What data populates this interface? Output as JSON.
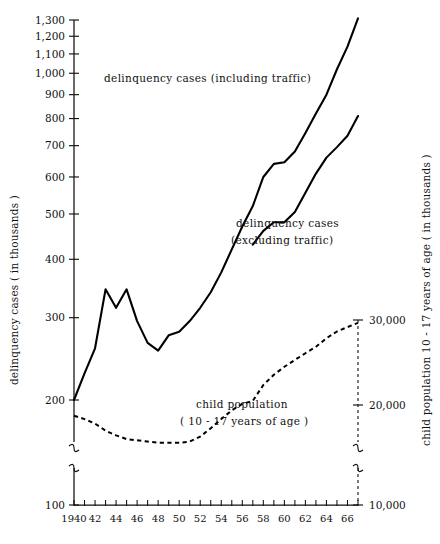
{
  "chart_data": {
    "type": "line",
    "title": "",
    "subtitle": "",
    "xlabel": "",
    "ylabel": "delinquency cases ( in thousands )",
    "y2label": "child population 10 - 17 years of age ( in thousands )",
    "scale": "log",
    "grid": false,
    "legend_position": "inline-annotation",
    "xlim": [
      1940,
      1967
    ],
    "ylim": [
      100,
      1300
    ],
    "y2lim": [
      10000,
      30000
    ],
    "x_tick_labels": [
      "1940",
      "42",
      "44",
      "46",
      "48",
      "50",
      "52",
      "54",
      "56",
      "58",
      "60",
      "62",
      "64",
      "66"
    ],
    "x_tick_values": [
      1940,
      1942,
      1944,
      1946,
      1948,
      1950,
      1952,
      1954,
      1956,
      1958,
      1960,
      1962,
      1964,
      1966
    ],
    "x_minor_ticks": [
      1941,
      1943,
      1945,
      1947,
      1949,
      1951,
      1953,
      1955,
      1957,
      1959,
      1961,
      1963,
      1965,
      1967
    ],
    "y_tick_labels": [
      "100",
      "200",
      "300",
      "400",
      "500",
      "600",
      "700",
      "800",
      "900",
      "1,000",
      "1,100",
      "1,200",
      "1,300"
    ],
    "y_tick_values": [
      100,
      200,
      300,
      400,
      500,
      600,
      700,
      800,
      900,
      1000,
      1100,
      1200,
      1300
    ],
    "y_axis_break_after": 100,
    "y2_tick_labels": [
      "10,000",
      "20,000",
      "30,000"
    ],
    "y2_tick_values": [
      10000,
      20000,
      30000
    ],
    "y2_axis_break_after": 10000,
    "series": [
      {
        "name": "delinquency cases (including traffic)",
        "annotation": "delinquency cases (including traffic)",
        "style": "solid",
        "axis": "left",
        "x": [
          1940,
          1941,
          1942,
          1943,
          1944,
          1945,
          1946,
          1947,
          1948,
          1949,
          1950,
          1951,
          1952,
          1953,
          1954,
          1955,
          1956,
          1957,
          1958,
          1959,
          1960,
          1961,
          1962,
          1963,
          1964,
          1965,
          1966,
          1967
        ],
        "values": [
          200,
          228,
          258,
          345,
          315,
          345,
          295,
          265,
          255,
          275,
          280,
          295,
          315,
          340,
          375,
          420,
          470,
          520,
          600,
          640,
          645,
          680,
          745,
          820,
          900,
          1020,
          1140,
          1310
        ]
      },
      {
        "name": "delinquency cases (excluding traffic)",
        "annotation_line1": "delinquency cases",
        "annotation_line2": "(excluding traffic)",
        "style": "solid",
        "axis": "left",
        "x": [
          1957,
          1958,
          1959,
          1960,
          1961,
          1962,
          1963,
          1964,
          1965,
          1966,
          1967
        ],
        "values": [
          430,
          460,
          480,
          480,
          505,
          555,
          610,
          660,
          695,
          735,
          810
        ]
      },
      {
        "name": "child population (10 - 17 years of age)",
        "annotation_line1": "child population",
        "annotation_line2": "( 10 - 17 years of age )",
        "style": "dashed",
        "axis": "right",
        "x": [
          1940,
          1941,
          1942,
          1943,
          1944,
          1945,
          1946,
          1947,
          1948,
          1949,
          1950,
          1951,
          1952,
          1953,
          1954,
          1955,
          1956,
          1957,
          1958,
          1959,
          1960,
          1961,
          1962,
          1963,
          1964,
          1965,
          1966,
          1967
        ],
        "values": [
          19000,
          18700,
          18300,
          17700,
          17300,
          17000,
          16900,
          16800,
          16700,
          16700,
          16700,
          16800,
          17200,
          17900,
          18700,
          19500,
          20100,
          20400,
          22000,
          23100,
          24000,
          24800,
          25600,
          26400,
          27500,
          28400,
          29000,
          29600
        ]
      }
    ],
    "annotations": [
      {
        "text": "delinquency cases (including traffic)",
        "x_px": 104,
        "y_px": 82
      },
      {
        "text": "delinquency cases",
        "x_px": 236,
        "y_px": 227
      },
      {
        "text": "(excluding traffic)",
        "x_px": 231,
        "y_px": 244
      },
      {
        "text": "child population",
        "x_px": 196,
        "y_px": 408
      },
      {
        "text": "( 10 - 17 years of age )",
        "x_px": 180,
        "y_px": 425
      }
    ]
  },
  "colors": {
    "ink": "#111111",
    "background": "#ffffff",
    "series_line": "#000000"
  }
}
